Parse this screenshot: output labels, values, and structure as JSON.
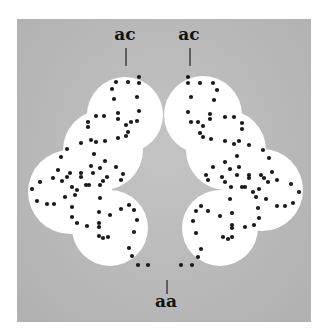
{
  "figure": {
    "labels": {
      "top_left": "ac",
      "top_right": "ac",
      "bottom": "aa"
    },
    "colors": {
      "panel": "#b8b8b8",
      "blob": "#ffffff",
      "dot": "#1a1a1a",
      "page": "#ffffff"
    },
    "left_blob_circles": [
      {
        "cx": 125,
        "cy": 115,
        "r": 38
      },
      {
        "cx": 103,
        "cy": 150,
        "r": 40
      },
      {
        "cx": 70,
        "cy": 192,
        "r": 42
      },
      {
        "cx": 110,
        "cy": 228,
        "r": 38
      }
    ],
    "right_blob_circles": [
      {
        "cx": 203,
        "cy": 115,
        "r": 39
      },
      {
        "cx": 226,
        "cy": 150,
        "r": 40
      },
      {
        "cx": 262,
        "cy": 190,
        "r": 41
      },
      {
        "cx": 220,
        "cy": 228,
        "r": 38
      }
    ],
    "left_dots": [
      [
        139,
        77
      ],
      [
        139,
        83
      ],
      [
        116,
        82
      ],
      [
        128,
        82
      ],
      [
        112,
        89
      ],
      [
        137,
        97
      ],
      [
        114,
        99
      ],
      [
        139,
        111
      ],
      [
        96,
        116
      ],
      [
        104,
        116
      ],
      [
        118,
        113
      ],
      [
        118,
        119
      ],
      [
        88,
        122
      ],
      [
        88,
        127
      ],
      [
        131,
        122
      ],
      [
        137,
        121
      ],
      [
        126,
        125
      ],
      [
        128,
        132
      ],
      [
        126,
        136
      ],
      [
        118,
        138
      ],
      [
        91,
        140
      ],
      [
        96,
        142
      ],
      [
        105,
        141
      ],
      [
        81,
        143
      ],
      [
        67,
        149
      ],
      [
        94,
        154
      ],
      [
        61,
        157
      ],
      [
        105,
        161
      ],
      [
        91,
        166
      ],
      [
        100,
        168
      ],
      [
        116,
        167
      ],
      [
        58,
        170
      ],
      [
        93,
        173
      ],
      [
        70,
        173
      ],
      [
        67,
        177
      ],
      [
        81,
        173
      ],
      [
        81,
        177
      ],
      [
        107,
        177
      ],
      [
        53,
        178
      ],
      [
        40,
        182
      ],
      [
        62,
        181
      ],
      [
        103,
        181
      ],
      [
        123,
        174
      ],
      [
        121,
        180
      ],
      [
        100,
        185
      ],
      [
        86,
        185
      ],
      [
        89,
        185
      ],
      [
        72,
        187
      ],
      [
        77,
        190
      ],
      [
        32,
        189
      ],
      [
        75,
        195
      ],
      [
        65,
        197
      ],
      [
        100,
        198
      ],
      [
        37,
        201
      ],
      [
        47,
        204
      ],
      [
        54,
        204
      ],
      [
        72,
        207
      ],
      [
        129,
        205
      ],
      [
        134,
        210
      ],
      [
        121,
        209
      ],
      [
        99,
        212
      ],
      [
        110,
        215
      ],
      [
        72,
        217
      ],
      [
        137,
        220
      ],
      [
        77,
        223
      ],
      [
        87,
        226
      ],
      [
        99,
        223
      ],
      [
        99,
        227
      ],
      [
        134,
        232
      ],
      [
        99,
        236
      ],
      [
        103,
        238
      ],
      [
        108,
        237
      ],
      [
        129,
        248
      ],
      [
        132,
        256
      ],
      [
        138,
        265
      ],
      [
        148,
        265
      ]
    ],
    "right_dots": [
      [
        188,
        77
      ],
      [
        188,
        83
      ],
      [
        200,
        83
      ],
      [
        213,
        83
      ],
      [
        217,
        90
      ],
      [
        191,
        97
      ],
      [
        214,
        100
      ],
      [
        188,
        112
      ],
      [
        210,
        114
      ],
      [
        210,
        119
      ],
      [
        225,
        117
      ],
      [
        234,
        117
      ],
      [
        191,
        122
      ],
      [
        198,
        122
      ],
      [
        203,
        126
      ],
      [
        242,
        123
      ],
      [
        242,
        129
      ],
      [
        200,
        133
      ],
      [
        203,
        137
      ],
      [
        211,
        139
      ],
      [
        225,
        141
      ],
      [
        234,
        144
      ],
      [
        239,
        141
      ],
      [
        249,
        145
      ],
      [
        263,
        150
      ],
      [
        237,
        156
      ],
      [
        269,
        158
      ],
      [
        225,
        162
      ],
      [
        213,
        167
      ],
      [
        230,
        169
      ],
      [
        239,
        167
      ],
      [
        206,
        175
      ],
      [
        208,
        180
      ],
      [
        222,
        177
      ],
      [
        225,
        182
      ],
      [
        237,
        175
      ],
      [
        249,
        175
      ],
      [
        249,
        178
      ],
      [
        261,
        175
      ],
      [
        264,
        178
      ],
      [
        272,
        172
      ],
      [
        277,
        180
      ],
      [
        268,
        182
      ],
      [
        231,
        187
      ],
      [
        242,
        187
      ],
      [
        245,
        187
      ],
      [
        259,
        189
      ],
      [
        253,
        192
      ],
      [
        291,
        184
      ],
      [
        299,
        192
      ],
      [
        256,
        197
      ],
      [
        230,
        199
      ],
      [
        266,
        199
      ],
      [
        277,
        206
      ],
      [
        285,
        206
      ],
      [
        293,
        203
      ],
      [
        201,
        206
      ],
      [
        196,
        211
      ],
      [
        208,
        211
      ],
      [
        258,
        208
      ],
      [
        232,
        213
      ],
      [
        220,
        216
      ],
      [
        259,
        218
      ],
      [
        193,
        221
      ],
      [
        232,
        225
      ],
      [
        232,
        228
      ],
      [
        245,
        227
      ],
      [
        254,
        225
      ],
      [
        196,
        233
      ],
      [
        223,
        237
      ],
      [
        228,
        239
      ],
      [
        232,
        237
      ],
      [
        201,
        249
      ],
      [
        198,
        257
      ],
      [
        192,
        265
      ],
      [
        181,
        265
      ]
    ]
  }
}
